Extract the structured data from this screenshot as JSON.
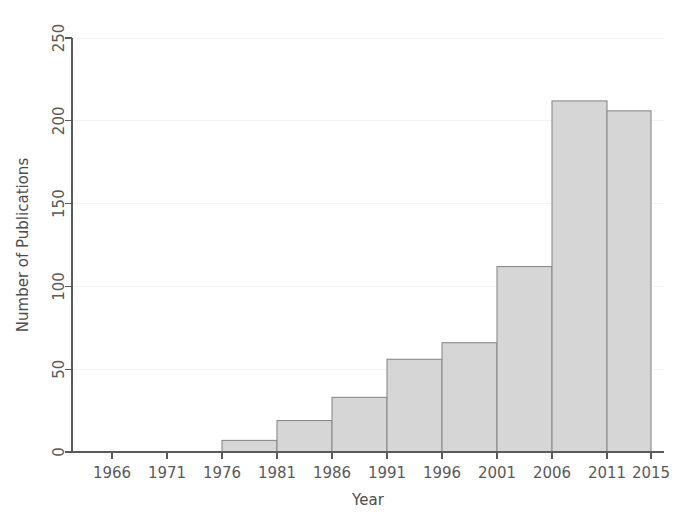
{
  "chart_data": {
    "type": "bar",
    "title": "",
    "subtitle": "",
    "xlabel": "Year",
    "ylabel": "Number of Publications",
    "categories": [
      "1966-1971",
      "1971-1976",
      "1976-1981",
      "1981-1986",
      "1986-1991",
      "1991-1996",
      "1996-2001",
      "2001-2006",
      "2006-2011",
      "2011-2015"
    ],
    "bin_edges": [
      1966,
      1971,
      1976,
      1981,
      1986,
      1991,
      1996,
      2001,
      2006,
      2011,
      2015
    ],
    "values": [
      0,
      0,
      7,
      19,
      33,
      56,
      66,
      112,
      212,
      206
    ],
    "xlim": [
      1964,
      2015
    ],
    "ylim": [
      0,
      250
    ],
    "xticks": [
      1966,
      1971,
      1976,
      1981,
      1986,
      1991,
      1996,
      2001,
      2006,
      2011,
      2015
    ],
    "xtick_labels": [
      "1966",
      "1971",
      "1976",
      "1981",
      "1986",
      "1991",
      "1996",
      "2001",
      "2006",
      "2011",
      "2015"
    ],
    "yticks": [
      0,
      50,
      100,
      150,
      200,
      250
    ],
    "ytick_labels": [
      "0",
      "50",
      "100",
      "150",
      "200",
      "250"
    ],
    "grid": "horizontal-faint",
    "legend": "none",
    "bar_fill_color": "#d6d6d6",
    "bar_edge_color": "#8a8a8a",
    "axis_color": "#5a5a5a",
    "background_color": "#ffffff",
    "tick_label_color": "#595959"
  }
}
